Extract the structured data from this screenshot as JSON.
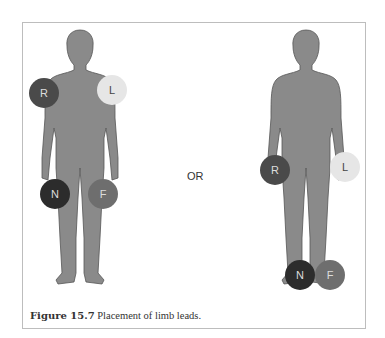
{
  "figure": {
    "separator": "OR",
    "caption_number": "Figure 15.7",
    "caption_text": "Placement of limb leads."
  },
  "colors": {
    "body": "#8a8a8a",
    "R": "#4a4a4a",
    "L": "#e6e6e6",
    "N": "#2c2c2c",
    "F": "#6e6e6e"
  },
  "left_diagram": {
    "electrodes": [
      {
        "label": "R",
        "position": "right shoulder"
      },
      {
        "label": "L",
        "position": "left shoulder"
      },
      {
        "label": "N",
        "position": "right hip"
      },
      {
        "label": "F",
        "position": "left hip"
      }
    ]
  },
  "right_diagram": {
    "electrodes": [
      {
        "label": "R",
        "position": "right wrist"
      },
      {
        "label": "L",
        "position": "left wrist"
      },
      {
        "label": "N",
        "position": "right ankle"
      },
      {
        "label": "F",
        "position": "left ankle"
      }
    ]
  }
}
